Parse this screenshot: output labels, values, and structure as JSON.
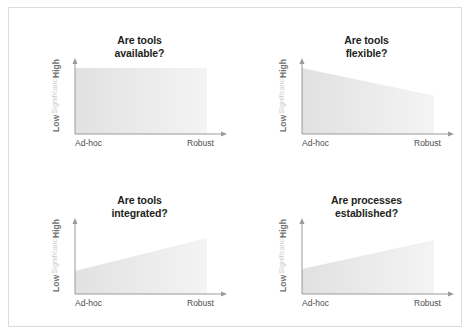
{
  "figure": {
    "background_color": "#ffffff",
    "border_color": "#dcdcdc",
    "fill_color_start": "#e3e3e3",
    "fill_color_end": "#f3f3f3",
    "axis_color": "#9a9a9a",
    "title_color": "#231f20",
    "axis_title_color": "#c9c9c9",
    "tick_color": "#4d4d4d"
  },
  "axes": {
    "y_axis_title": "Significance",
    "y_tick_high": "High",
    "y_tick_low": "Low",
    "x_tick_left": "Ad-hoc",
    "x_tick_right": "Robust"
  },
  "panels": [
    {
      "title_line1": "Are tools",
      "title_line2": "available?",
      "left_value": 100,
      "right_value": 100
    },
    {
      "title_line1": "Are tools",
      "title_line2": "flexible?",
      "left_value": 100,
      "right_value": 58
    },
    {
      "title_line1": "Are tools",
      "title_line2": "integrated?",
      "left_value": 35,
      "right_value": 85
    },
    {
      "title_line1": "Are processes",
      "title_line2": "established?",
      "left_value": 38,
      "right_value": 82
    }
  ],
  "chart_data": {
    "type": "area",
    "xlabel": "",
    "ylabel": "Significance",
    "x": [
      "Ad-hoc",
      "Robust"
    ],
    "xlim": [
      0,
      100
    ],
    "ylim": [
      0,
      100
    ],
    "ytick_labels": [
      "Low",
      "High"
    ],
    "grid": false,
    "legend": "none",
    "series": [
      {
        "name": "Are tools available?",
        "values": [
          100,
          100
        ]
      },
      {
        "name": "Are tools flexible?",
        "values": [
          100,
          58
        ]
      },
      {
        "name": "Are tools integrated?",
        "values": [
          35,
          85
        ]
      },
      {
        "name": "Are processes established?",
        "values": [
          38,
          82
        ]
      }
    ]
  }
}
